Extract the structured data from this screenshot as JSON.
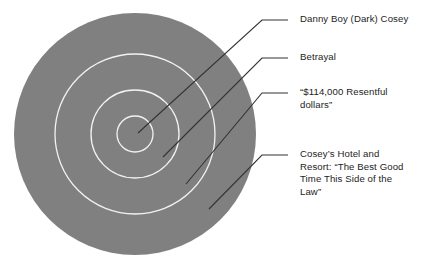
{
  "figure": {
    "type": "concentric-circle-diagram",
    "width": 436,
    "height": 271,
    "background_color": "#ffffff"
  },
  "colors": {
    "disc_fill": "#808080",
    "ring_stroke": "#f2f2f2",
    "leader_line": "#333333",
    "label_text": "#1d1d1d"
  },
  "diagram": {
    "center_x": 135,
    "center_y": 134,
    "rings": [
      {
        "name": "outer-ring",
        "radius": 121,
        "filled": true
      },
      {
        "name": "third-ring",
        "radius": 80,
        "filled": false
      },
      {
        "name": "second-ring",
        "radius": 44,
        "filled": false
      },
      {
        "name": "inner-ring",
        "radius": 18,
        "filled": false
      }
    ]
  },
  "callouts": [
    {
      "id": "callout-0",
      "label": "Danny Boy (Dark) Cosey",
      "ring": "inner-ring",
      "anchor_x": 138,
      "anchor_y": 133,
      "elbow_x": 262,
      "elbow_y": 20,
      "stub_x": 288,
      "stub_y": 20
    },
    {
      "id": "callout-1",
      "label": "Betrayal",
      "ring": "second-ring",
      "anchor_x": 163,
      "anchor_y": 157,
      "elbow_x": 262,
      "elbow_y": 58,
      "stub_x": 288,
      "stub_y": 58
    },
    {
      "id": "callout-2",
      "label": "“$114,000 Resentful\ndollars”",
      "ring": "third-ring",
      "anchor_x": 186,
      "anchor_y": 184,
      "elbow_x": 262,
      "elbow_y": 93,
      "stub_x": 288,
      "stub_y": 93
    },
    {
      "id": "callout-3",
      "label": "Cosey’s Hotel and\nResort: “The Best Good\nTime This Side of the\nLaw”",
      "ring": "outer-ring",
      "anchor_x": 209,
      "anchor_y": 209,
      "elbow_x": 262,
      "elbow_y": 155,
      "stub_x": 288,
      "stub_y": 155
    }
  ]
}
